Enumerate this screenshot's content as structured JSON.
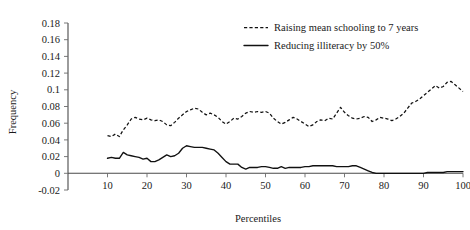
{
  "chart_data": {
    "type": "line",
    "title": "",
    "xlabel": "Percentiles",
    "ylabel": "Frequency",
    "xlim": [
      0,
      100
    ],
    "ylim": [
      -0.02,
      0.18
    ],
    "xticks": [
      10,
      20,
      30,
      40,
      50,
      60,
      70,
      80,
      90,
      100
    ],
    "xtick_labels": [
      "10",
      "20",
      "30",
      "40",
      "50",
      "60",
      "70",
      "80",
      "90",
      "100"
    ],
    "yticks": [
      -0.02,
      0,
      0.02,
      0.04,
      0.06,
      0.08,
      0.1,
      0.12,
      0.14,
      0.16,
      0.18
    ],
    "ytick_labels": [
      "-0.02",
      "0",
      "0.02",
      "0.04",
      "0.06",
      "0.08",
      "0.1",
      "0.12",
      "0.14",
      "0.16",
      "0.18"
    ],
    "grid": false,
    "legend_position": "top-right",
    "series": [
      {
        "name": "Raising mean schooling to 7 years",
        "style": "dashed",
        "color": "#111111",
        "x": [
          10,
          11,
          12,
          13,
          14,
          15,
          16,
          17,
          18,
          19,
          20,
          21,
          22,
          23,
          24,
          25,
          26,
          27,
          28,
          29,
          30,
          31,
          32,
          33,
          34,
          35,
          36,
          37,
          38,
          39,
          40,
          41,
          42,
          43,
          44,
          45,
          46,
          47,
          48,
          49,
          50,
          51,
          52,
          53,
          54,
          55,
          56,
          57,
          58,
          59,
          60,
          61,
          62,
          63,
          64,
          65,
          66,
          67,
          68,
          69,
          70,
          71,
          72,
          73,
          74,
          75,
          76,
          77,
          78,
          79,
          80,
          81,
          82,
          83,
          84,
          85,
          86,
          87,
          88,
          89,
          90,
          91,
          92,
          93,
          94,
          95,
          96,
          97,
          98,
          99,
          100
        ],
        "y": [
          0.045,
          0.044,
          0.047,
          0.044,
          0.052,
          0.058,
          0.065,
          0.067,
          0.065,
          0.064,
          0.066,
          0.064,
          0.063,
          0.064,
          0.062,
          0.058,
          0.057,
          0.061,
          0.066,
          0.07,
          0.074,
          0.076,
          0.078,
          0.077,
          0.073,
          0.07,
          0.072,
          0.07,
          0.067,
          0.062,
          0.059,
          0.062,
          0.066,
          0.065,
          0.068,
          0.072,
          0.074,
          0.073,
          0.074,
          0.073,
          0.074,
          0.072,
          0.066,
          0.062,
          0.059,
          0.061,
          0.064,
          0.067,
          0.065,
          0.062,
          0.059,
          0.056,
          0.058,
          0.062,
          0.064,
          0.063,
          0.066,
          0.065,
          0.072,
          0.079,
          0.073,
          0.069,
          0.066,
          0.065,
          0.066,
          0.068,
          0.067,
          0.062,
          0.064,
          0.067,
          0.066,
          0.065,
          0.063,
          0.065,
          0.068,
          0.072,
          0.078,
          0.084,
          0.086,
          0.089,
          0.093,
          0.097,
          0.101,
          0.105,
          0.102,
          0.104,
          0.109,
          0.11,
          0.106,
          0.102,
          0.098
        ]
      },
      {
        "name": "Reducing illiteracy by 50%",
        "style": "solid",
        "color": "#111111",
        "x": [
          10,
          11,
          12,
          13,
          14,
          15,
          16,
          17,
          18,
          19,
          20,
          21,
          22,
          23,
          24,
          25,
          26,
          27,
          28,
          29,
          30,
          31,
          32,
          33,
          34,
          35,
          36,
          37,
          38,
          39,
          40,
          41,
          42,
          43,
          44,
          45,
          46,
          47,
          48,
          49,
          50,
          51,
          52,
          53,
          54,
          55,
          56,
          57,
          58,
          59,
          60,
          61,
          62,
          63,
          64,
          65,
          66,
          67,
          68,
          69,
          70,
          71,
          72,
          73,
          74,
          75,
          76,
          77,
          78,
          79,
          80,
          81,
          82,
          83,
          84,
          85,
          86,
          87,
          88,
          89,
          90,
          91,
          92,
          93,
          94,
          95,
          96,
          97,
          98,
          99,
          100
        ],
        "y": [
          0.018,
          0.019,
          0.018,
          0.018,
          0.025,
          0.022,
          0.021,
          0.02,
          0.019,
          0.017,
          0.018,
          0.014,
          0.014,
          0.016,
          0.019,
          0.022,
          0.02,
          0.021,
          0.024,
          0.03,
          0.033,
          0.032,
          0.031,
          0.031,
          0.031,
          0.03,
          0.029,
          0.028,
          0.024,
          0.019,
          0.014,
          0.011,
          0.011,
          0.011,
          0.007,
          0.005,
          0.007,
          0.007,
          0.007,
          0.008,
          0.008,
          0.007,
          0.006,
          0.006,
          0.008,
          0.006,
          0.007,
          0.007,
          0.007,
          0.007,
          0.008,
          0.008,
          0.009,
          0.009,
          0.009,
          0.009,
          0.009,
          0.009,
          0.008,
          0.008,
          0.008,
          0.008,
          0.009,
          0.009,
          0.007,
          0.005,
          0.003,
          0.001,
          0.0,
          0.0,
          0.0,
          0.0,
          0.0,
          0.0,
          0.0,
          0.0,
          0.0,
          0.0,
          0.0,
          0.0,
          0.0,
          0.001,
          0.001,
          0.001,
          0.001,
          0.001,
          0.002,
          0.002,
          0.002,
          0.002,
          0.002
        ]
      }
    ]
  },
  "legend": {
    "entries": [
      {
        "label": "Raising mean schooling to 7 years",
        "style": "dashed"
      },
      {
        "label": "Reducing illiteracy by 50%",
        "style": "solid"
      }
    ]
  },
  "axes": {
    "y_title": "Frequency",
    "x_title": "Percentiles"
  }
}
